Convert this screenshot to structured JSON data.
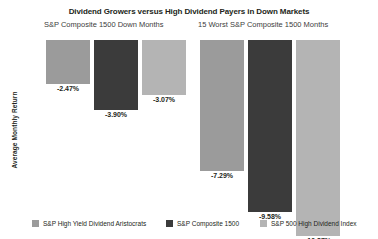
{
  "chart_data": {
    "type": "bar",
    "title": "Dividend Growers versus High Dividend Payers in Down Markets",
    "xlabel": "",
    "ylabel": "Average Monthly Return",
    "grid": false,
    "legend_position": "bottom",
    "orientation": "vertical-negative",
    "baseline": 0,
    "ylim": [
      -11.5,
      0
    ],
    "categories": [
      "S&P Composite 1500 Down Months",
      "15 Worst S&P Composite 1500 Months"
    ],
    "series": [
      {
        "name": "S&P High Yield Dividend Aristocrats",
        "color": "#9b9b9b",
        "values": [
          -2.47,
          -7.29
        ],
        "labels": [
          "-2.47%",
          "-7.29%"
        ]
      },
      {
        "name": "S&P Composite 1500",
        "color": "#3b3b3b",
        "values": [
          -3.9,
          -9.58
        ],
        "labels": [
          "-3.90%",
          "-9.58%"
        ]
      },
      {
        "name": "S&P 500 High Dividend Index",
        "color": "#b4b4b4",
        "values": [
          -3.07,
          -10.87
        ],
        "labels": [
          "-3.07%",
          "-10.87%"
        ]
      }
    ]
  },
  "header": {
    "title": "Dividend Growers versus High Dividend Payers in Down Markets",
    "subtitle_left": "S&P Composite 1500 Down Months",
    "subtitle_right": "15 Worst S&P Composite 1500 Months"
  },
  "axis": {
    "y_title": "Average Monthly Return"
  },
  "legend": {
    "items": [
      {
        "label": "S&P High Yield Dividend Aristocrats",
        "color": "#9b9b9b"
      },
      {
        "label": "S&P Composite 1500",
        "color": "#3b3b3b"
      },
      {
        "label": "S&P 500 High Dividend Index",
        "color": "#b4b4b4"
      }
    ]
  }
}
